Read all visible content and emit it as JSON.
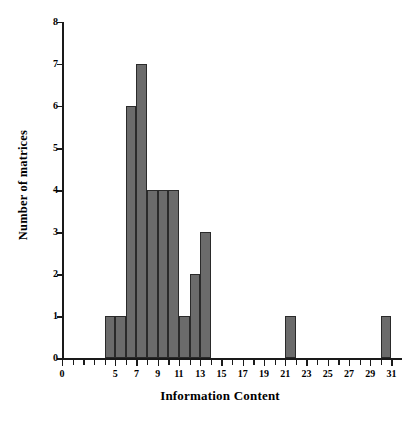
{
  "chart_data": {
    "type": "bar",
    "title": "",
    "subtitle": "",
    "xlabel": "Information Content",
    "ylabel": "Number of matrices",
    "xlim": [
      0,
      32
    ],
    "ylim": [
      0,
      8
    ],
    "grid": false,
    "legend": null,
    "bin_width": 1,
    "bins": [
      {
        "start": 4,
        "end": 5,
        "value": 1
      },
      {
        "start": 5,
        "end": 6,
        "value": 1
      },
      {
        "start": 6,
        "end": 7,
        "value": 6
      },
      {
        "start": 7,
        "end": 8,
        "value": 7
      },
      {
        "start": 8,
        "end": 9,
        "value": 4
      },
      {
        "start": 9,
        "end": 10,
        "value": 4
      },
      {
        "start": 10,
        "end": 11,
        "value": 4
      },
      {
        "start": 11,
        "end": 12,
        "value": 1
      },
      {
        "start": 12,
        "end": 13,
        "value": 2
      },
      {
        "start": 13,
        "end": 14,
        "value": 3
      },
      {
        "start": 21,
        "end": 22,
        "value": 1
      },
      {
        "start": 30,
        "end": 31,
        "value": 1
      }
    ],
    "categories": [
      "4-5",
      "5-6",
      "6-7",
      "7-8",
      "8-9",
      "9-10",
      "10-11",
      "11-12",
      "12-13",
      "13-14",
      "21-22",
      "30-31"
    ],
    "values": [
      1,
      1,
      6,
      7,
      4,
      4,
      4,
      1,
      2,
      3,
      1,
      1
    ],
    "y_ticks": [
      0,
      1,
      2,
      3,
      4,
      5,
      6,
      7,
      8
    ],
    "y_tick_labels": [
      "0",
      "1",
      "2",
      "3",
      "4",
      "5",
      "6",
      "7",
      "8"
    ],
    "x_ticks": [
      0,
      1,
      2,
      3,
      4,
      5,
      6,
      7,
      8,
      9,
      10,
      11,
      12,
      13,
      14,
      15,
      16,
      17,
      18,
      19,
      20,
      21,
      22,
      23,
      24,
      25,
      26,
      27,
      28,
      29,
      30,
      31,
      32
    ],
    "x_labeled_ticks": [
      0,
      5,
      7,
      9,
      11,
      13,
      15,
      17,
      19,
      21,
      23,
      25,
      27,
      29,
      31
    ],
    "x_tick_labels": [
      "0",
      "5",
      "7",
      "9",
      "11",
      "13",
      "15",
      "17",
      "19",
      "21",
      "23",
      "25",
      "27",
      "29",
      "31"
    ],
    "colors": {
      "bar_fill": "#6b6b6b",
      "bar_stroke": "#2a2a2a",
      "axis": "#1a1a1a",
      "text": "#000000",
      "background": "#ffffff"
    }
  }
}
